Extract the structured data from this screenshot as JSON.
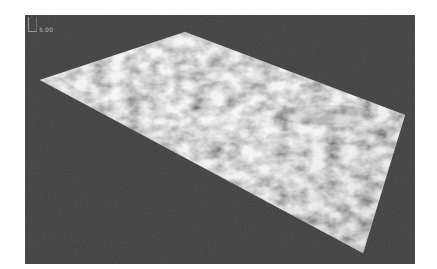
{
  "viewport": {
    "background_color": "#2f2f2f",
    "scale_label": "5.00",
    "axis_icon": "axis-bracket-icon"
  },
  "terrain": {
    "description": "3D rendered height-map surface",
    "corners_px": {
      "left": [
        15,
        65
      ],
      "top": [
        160,
        17
      ],
      "right": [
        380,
        100
      ],
      "bottom": [
        338,
        238
      ]
    },
    "texture_colors": {
      "light": "#e8e8e8",
      "mid": "#a8a8a8",
      "dark": "#6e6e6e"
    }
  }
}
